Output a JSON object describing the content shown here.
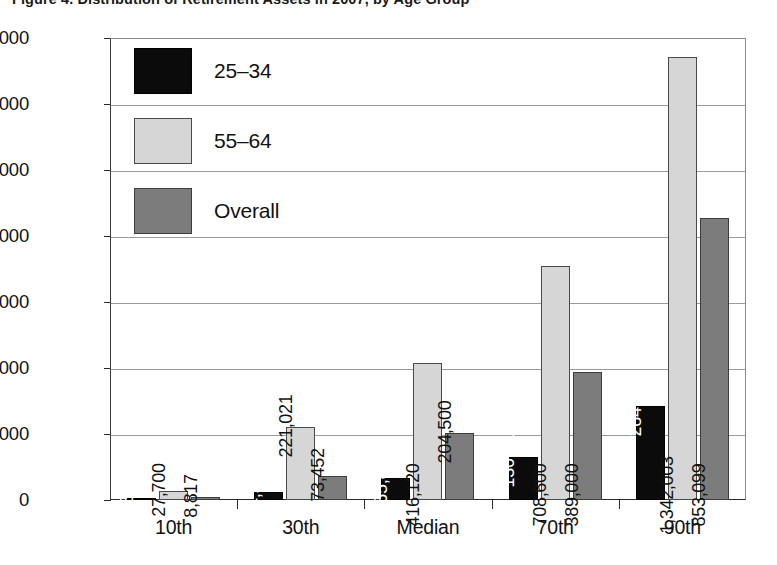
{
  "figure": {
    "title_clipped": "Figure 4. Distribution of Retirement Assets in 2007, by Age Group"
  },
  "legend": {
    "position": "inside-top-left",
    "entries": [
      {
        "label": "25–34",
        "color": "#0b0b0b",
        "swatch": "legend-swatch-25-34"
      },
      {
        "label": "55–64",
        "color": "#d6d6d6",
        "swatch": "legend-swatch-55-64"
      },
      {
        "label": "Overall",
        "color": "#7c7c7c",
        "swatch": "legend-swatch-overall"
      }
    ]
  },
  "axes": {
    "y_ticks": [
      "0",
      "200,000",
      "400,000",
      "600,000",
      "800,000",
      "1,000,000",
      "1,200,000",
      "1,400,000"
    ],
    "y_tick_values": [
      0,
      200000,
      400000,
      600000,
      800000,
      1000000,
      1200000,
      1400000
    ],
    "ylim": [
      0,
      1400000
    ],
    "x_categories": [
      "10th",
      "30th",
      "Median",
      "70th",
      "90th"
    ]
  },
  "chart_data": {
    "type": "bar",
    "title": "Figure 4. Distribution of Retirement Assets in 2007, by Age Group",
    "xlabel": "",
    "ylabel": "",
    "ylim": [
      0,
      1400000
    ],
    "grid": true,
    "legend_position": "inside-top-left",
    "categories": [
      "10th",
      "30th",
      "Median",
      "70th",
      "90th"
    ],
    "series": [
      {
        "name": "25–34",
        "color": "#0b0b0b",
        "values": [
          3570,
          24510,
          65886,
          130213,
          284507
        ],
        "labels": [
          "3,570",
          "24,510",
          "65,886",
          "130,213",
          "284,507"
        ]
      },
      {
        "name": "55–64",
        "color": "#d6d6d6",
        "values": [
          27700,
          221021,
          416120,
          708600,
          1342003
        ],
        "labels": [
          "27,700",
          "221,021",
          "416,120",
          "708,600",
          "1,342,003"
        ]
      },
      {
        "name": "Overall",
        "color": "#7c7c7c",
        "values": [
          8817,
          73452,
          204500,
          389000,
          853099
        ],
        "labels": [
          "8,817",
          "73,452",
          "204,500",
          "389,000",
          "853,099"
        ]
      }
    ]
  }
}
